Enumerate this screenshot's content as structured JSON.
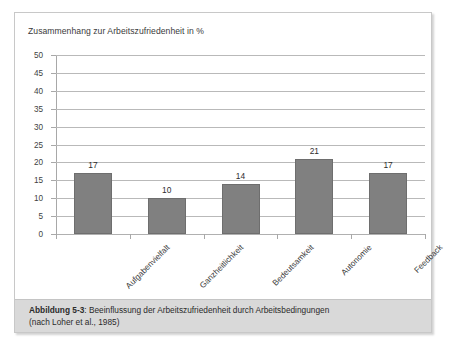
{
  "figure": {
    "caption_label": "Abbildung 5-3",
    "caption_separator": ": ",
    "caption_text": "Beeinflussung der Arbeitszufriedenheit durch Arbeitsbedingungen",
    "caption_source": "(nach Loher et al., 1985)"
  },
  "colors": {
    "bar_fill": "#808080",
    "bar_border": "#6e6e6e",
    "gridline": "#b9b9b9",
    "caption_background": "#d9d9d9",
    "frame_border": "#c8c8c8"
  },
  "chart_data": {
    "type": "bar",
    "title": "Zusammenhang zur Arbeitszufriedenheit in %",
    "xlabel": "",
    "ylabel": "",
    "ylim": [
      0,
      50
    ],
    "ytick_step": 5,
    "yticks": [
      0,
      5,
      10,
      15,
      20,
      25,
      30,
      35,
      40,
      45,
      50
    ],
    "ytick_labels": [
      "0",
      "5",
      "10",
      "15",
      "20",
      "25",
      "30",
      "35",
      "40",
      "45",
      "50"
    ],
    "grid": true,
    "legend": false,
    "categories": [
      "Aufgabenvielfalt",
      "Ganzheitlichkeit",
      "Bedeutsamkeit",
      "Autonomie",
      "Feedback"
    ],
    "values": [
      17,
      10,
      14,
      21,
      17
    ],
    "value_labels": [
      "17",
      "10",
      "14",
      "21",
      "17"
    ]
  }
}
